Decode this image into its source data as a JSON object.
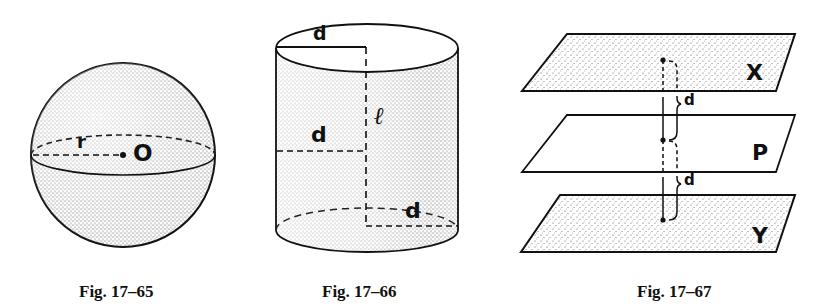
{
  "figures": [
    {
      "caption": "Fig. 17–65",
      "shape": "sphere",
      "labels": {
        "radius": "r",
        "center": "O"
      }
    },
    {
      "caption": "Fig. 17–66",
      "shape": "cylinder",
      "labels": {
        "top_radius": "d",
        "middle_distance": "d",
        "axis": "ℓ",
        "bottom_radius": "d"
      }
    },
    {
      "caption": "Fig. 17–67",
      "shape": "parallel-planes",
      "labels": {
        "top_plane": "X",
        "middle_plane": "P",
        "bottom_plane": "Y",
        "upper_distance": "d",
        "lower_distance": "d"
      }
    }
  ]
}
